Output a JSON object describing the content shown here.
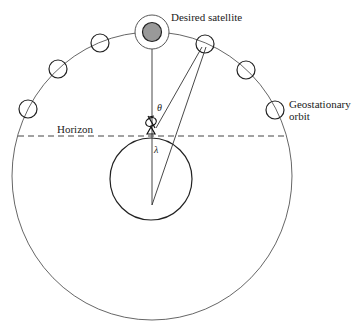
{
  "diagram": {
    "labels": {
      "desired_satellite": "Desired satellite",
      "horizon": "Horizon",
      "geo_line1": "Geostationary",
      "geo_line2": "orbit",
      "theta": "θ",
      "lambda": "λ"
    },
    "colors": {
      "stroke": "#333333",
      "desired_fill": "#999999",
      "background": "#ffffff"
    },
    "orbit": {
      "cx": 152,
      "cy": 176,
      "rx": 140,
      "ry": 144
    },
    "earth": {
      "cx": 151,
      "cy": 179,
      "r": 41
    },
    "horizon_y": 136,
    "desired_satellite": {
      "cx": 152,
      "cy": 32,
      "r": 9,
      "ring_r": 17
    },
    "other_satellites": [
      {
        "cx": 28,
        "cy": 109
      },
      {
        "cx": 58,
        "cy": 69
      },
      {
        "cx": 100,
        "cy": 43
      },
      {
        "cx": 205,
        "cy": 44
      },
      {
        "cx": 246,
        "cy": 70
      },
      {
        "cx": 275,
        "cy": 110
      }
    ]
  }
}
